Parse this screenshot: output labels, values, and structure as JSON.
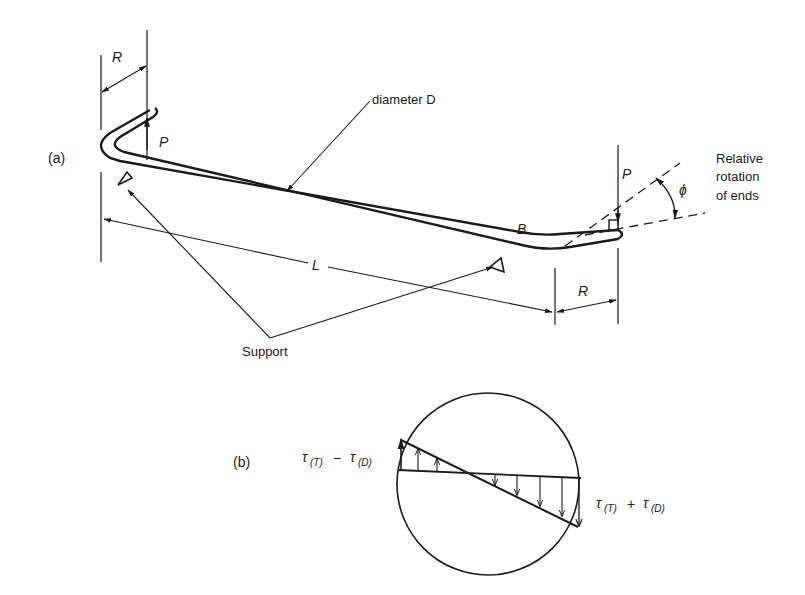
{
  "figure": {
    "part_a": {
      "tag": "(a)",
      "labels": {
        "radius_left": "R",
        "radius_right": "R",
        "load_left": "P",
        "load_right": "P",
        "diameter": "diameter D",
        "point_b": "B",
        "length": "L",
        "angle": "ϕ",
        "rotation_line1": "Relative",
        "rotation_line2": "rotation",
        "rotation_line3": "of ends",
        "support": "Support"
      }
    },
    "part_b": {
      "tag": "(b)",
      "labels": {
        "tau_minus_main": "τ",
        "tau_minus_sub1": "(T)",
        "tau_minus_op": "−",
        "tau_minus_sub2": "(D)",
        "tau_plus_main": "τ",
        "tau_plus_sub1": "(T)",
        "tau_plus_op": "+",
        "tau_plus_sub2": "(D)"
      }
    }
  }
}
